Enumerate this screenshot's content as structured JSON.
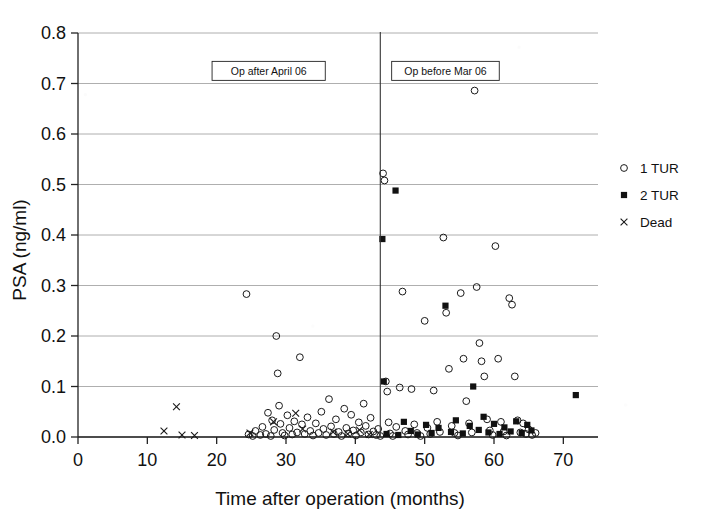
{
  "chart_data": {
    "type": "scatter",
    "title": "",
    "xlabel": "Time after operation (months)",
    "ylabel": "PSA (ng/ml)",
    "xlim": [
      0,
      75
    ],
    "ylim": [
      0,
      0.8
    ],
    "xticks": [
      0,
      10,
      20,
      30,
      40,
      50,
      60,
      70
    ],
    "xtick_labels": [
      "0",
      "10",
      "20",
      "30",
      "40",
      "50",
      "60",
      "70"
    ],
    "yticks": [
      0.0,
      0.1,
      0.2,
      0.3,
      0.4,
      0.5,
      0.6,
      0.7,
      0.8
    ],
    "ytick_labels": [
      "0.0",
      "0.1",
      "0.2",
      "0.3",
      "0.4",
      "0.5",
      "0.6",
      "0.7",
      "0.8"
    ],
    "grid": "horizontal",
    "legend_position": "right",
    "legend": [
      {
        "name": "1 TUR",
        "marker": "open-circle"
      },
      {
        "name": "2 TUR",
        "marker": "filled-square"
      },
      {
        "name": "Dead",
        "marker": "x-cross"
      }
    ],
    "annotations": [
      {
        "text": "Op after April 06",
        "x": 27.5,
        "y": 0.725,
        "boxed": true
      },
      {
        "text": "Op before Mar 06",
        "x": 53.0,
        "y": 0.725,
        "boxed": true
      },
      {
        "text": "divider",
        "type": "vline",
        "x": 43.6
      }
    ],
    "series": [
      {
        "name": "1 TUR",
        "marker": "open-circle",
        "points": [
          [
            24.3,
            0.283
          ],
          [
            24.6,
            0.005
          ],
          [
            25.2,
            0.002
          ],
          [
            25.6,
            0.012
          ],
          [
            26.3,
            0.004
          ],
          [
            26.6,
            0.02
          ],
          [
            27.1,
            0.006
          ],
          [
            27.4,
            0.048
          ],
          [
            27.8,
            0.002
          ],
          [
            28.0,
            0.033
          ],
          [
            28.3,
            0.014
          ],
          [
            28.6,
            0.2
          ],
          [
            28.8,
            0.126
          ],
          [
            29.0,
            0.062
          ],
          [
            29.2,
            0.026
          ],
          [
            29.5,
            0.008
          ],
          [
            29.8,
            0.003
          ],
          [
            30.2,
            0.043
          ],
          [
            30.5,
            0.018
          ],
          [
            30.9,
            0.005
          ],
          [
            31.2,
            0.031
          ],
          [
            31.6,
            0.009
          ],
          [
            32.0,
            0.158
          ],
          [
            32.3,
            0.025
          ],
          [
            32.7,
            0.006
          ],
          [
            33.1,
            0.039
          ],
          [
            33.5,
            0.012
          ],
          [
            33.9,
            0.003
          ],
          [
            34.3,
            0.027
          ],
          [
            34.7,
            0.008
          ],
          [
            35.1,
            0.05
          ],
          [
            35.4,
            0.016
          ],
          [
            35.8,
            0.004
          ],
          [
            36.2,
            0.075
          ],
          [
            36.5,
            0.021
          ],
          [
            36.9,
            0.006
          ],
          [
            37.2,
            0.035
          ],
          [
            37.6,
            0.01
          ],
          [
            38.0,
            0.002
          ],
          [
            38.4,
            0.056
          ],
          [
            38.7,
            0.018
          ],
          [
            39.0,
            0.007
          ],
          [
            39.4,
            0.044
          ],
          [
            39.7,
            0.013
          ],
          [
            40.1,
            0.003
          ],
          [
            40.5,
            0.029
          ],
          [
            40.8,
            0.009
          ],
          [
            41.2,
            0.066
          ],
          [
            41.5,
            0.022
          ],
          [
            41.9,
            0.005
          ],
          [
            42.2,
            0.038
          ],
          [
            42.6,
            0.011
          ],
          [
            43.0,
            0.004
          ],
          [
            43.3,
            0.016
          ],
          [
            43.6,
            0.002
          ],
          [
            44.0,
            0.522
          ],
          [
            44.2,
            0.508
          ],
          [
            44.4,
            0.11
          ],
          [
            44.6,
            0.09
          ],
          [
            44.8,
            0.029
          ],
          [
            45.0,
            0.007
          ],
          [
            45.4,
            0.002
          ],
          [
            45.9,
            0.02
          ],
          [
            46.4,
            0.098
          ],
          [
            46.8,
            0.288
          ],
          [
            47.2,
            0.012
          ],
          [
            47.6,
            0.005
          ],
          [
            48.1,
            0.095
          ],
          [
            48.5,
            0.025
          ],
          [
            48.9,
            0.008
          ],
          [
            49.4,
            0.002
          ],
          [
            50.0,
            0.23
          ],
          [
            50.4,
            0.018
          ],
          [
            50.8,
            0.006
          ],
          [
            51.3,
            0.092
          ],
          [
            51.8,
            0.03
          ],
          [
            52.2,
            0.01
          ],
          [
            52.7,
            0.395
          ],
          [
            53.1,
            0.246
          ],
          [
            53.5,
            0.135
          ],
          [
            53.9,
            0.022
          ],
          [
            54.3,
            0.008
          ],
          [
            54.8,
            0.003
          ],
          [
            55.2,
            0.285
          ],
          [
            55.6,
            0.155
          ],
          [
            56.0,
            0.071
          ],
          [
            56.4,
            0.027
          ],
          [
            56.8,
            0.009
          ],
          [
            57.2,
            0.686
          ],
          [
            57.5,
            0.297
          ],
          [
            57.9,
            0.186
          ],
          [
            58.2,
            0.15
          ],
          [
            58.6,
            0.12
          ],
          [
            59.0,
            0.035
          ],
          [
            59.4,
            0.013
          ],
          [
            59.8,
            0.004
          ],
          [
            60.2,
            0.378
          ],
          [
            60.6,
            0.155
          ],
          [
            61.0,
            0.03
          ],
          [
            61.4,
            0.011
          ],
          [
            61.8,
            0.003
          ],
          [
            62.2,
            0.275
          ],
          [
            62.6,
            0.262
          ],
          [
            63.0,
            0.12
          ],
          [
            63.4,
            0.033
          ],
          [
            63.8,
            0.009
          ],
          [
            64.2,
            0.027
          ],
          [
            64.6,
            0.006
          ],
          [
            65.0,
            0.015
          ],
          [
            65.5,
            0.004
          ],
          [
            66.0,
            0.008
          ]
        ]
      },
      {
        "name": "2 TUR",
        "marker": "filled-square",
        "points": [
          [
            43.9,
            0.392
          ],
          [
            44.1,
            0.11
          ],
          [
            44.5,
            0.006
          ],
          [
            45.8,
            0.488
          ],
          [
            46.2,
            0.004
          ],
          [
            47.0,
            0.03
          ],
          [
            48.0,
            0.012
          ],
          [
            49.0,
            0.005
          ],
          [
            50.2,
            0.024
          ],
          [
            51.0,
            0.008
          ],
          [
            52.0,
            0.018
          ],
          [
            53.0,
            0.26
          ],
          [
            53.8,
            0.01
          ],
          [
            54.5,
            0.033
          ],
          [
            55.5,
            0.007
          ],
          [
            56.5,
            0.022
          ],
          [
            57.0,
            0.1
          ],
          [
            57.8,
            0.014
          ],
          [
            58.5,
            0.04
          ],
          [
            59.2,
            0.009
          ],
          [
            60.0,
            0.026
          ],
          [
            60.8,
            0.006
          ],
          [
            61.5,
            0.019
          ],
          [
            62.4,
            0.011
          ],
          [
            63.2,
            0.031
          ],
          [
            64.0,
            0.008
          ],
          [
            64.8,
            0.024
          ],
          [
            65.4,
            0.013
          ],
          [
            71.8,
            0.083
          ]
        ]
      },
      {
        "name": "Dead",
        "marker": "x-cross",
        "points": [
          [
            12.4,
            0.012
          ],
          [
            14.2,
            0.06
          ],
          [
            15.0,
            0.004
          ],
          [
            16.8,
            0.003
          ],
          [
            24.8,
            0.008
          ],
          [
            28.2,
            0.03
          ],
          [
            31.4,
            0.047
          ],
          [
            32.4,
            0.016
          ],
          [
            36.8,
            0.01
          ],
          [
            38.9,
            0.006
          ],
          [
            40.6,
            0.014
          ],
          [
            42.0,
            0.005
          ]
        ]
      }
    ]
  }
}
